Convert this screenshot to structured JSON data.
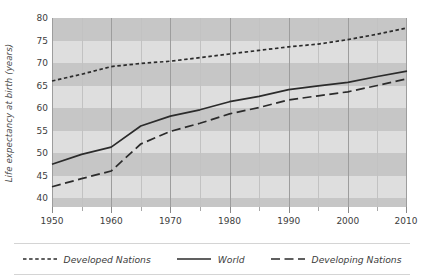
{
  "chart_data": {
    "type": "line",
    "title": "",
    "xlabel": "",
    "ylabel": "Life expectancy at birth (years)",
    "xlim": [
      1950,
      2010
    ],
    "ylim": [
      38,
      80
    ],
    "grid": true,
    "legend_position": "bottom",
    "y_ticks": [
      40,
      45,
      50,
      55,
      60,
      65,
      70,
      75,
      80
    ],
    "x_ticks": [
      1950,
      1960,
      1970,
      1980,
      1990,
      2000,
      2010
    ],
    "x_minor_ticks": [
      1955,
      1965,
      1975,
      1985,
      1995,
      2005
    ],
    "x": [
      1950,
      1955,
      1960,
      1965,
      1970,
      1975,
      1980,
      1985,
      1990,
      1995,
      2000,
      2005,
      2010
    ],
    "series": [
      {
        "name": "Developed Nations",
        "style": "dotted",
        "color": "#2b2b2b",
        "values": [
          66.0,
          67.5,
          69.2,
          69.9,
          70.4,
          71.2,
          72.0,
          72.8,
          73.6,
          74.2,
          75.2,
          76.4,
          77.8
        ]
      },
      {
        "name": "World",
        "style": "solid",
        "color": "#2b2b2b",
        "values": [
          47.5,
          49.7,
          51.3,
          56.0,
          58.2,
          59.6,
          61.4,
          62.6,
          64.1,
          64.9,
          65.7,
          67.0,
          68.2
        ]
      },
      {
        "name": "Developing Nations",
        "style": "dashed",
        "color": "#2b2b2b",
        "values": [
          42.5,
          44.3,
          46.0,
          52.0,
          54.8,
          56.6,
          58.7,
          60.1,
          61.8,
          62.7,
          63.6,
          65.0,
          66.5
        ]
      }
    ]
  },
  "axes": {
    "y_title": "Life expectancy at birth (years)",
    "y_tick_labels": [
      "80",
      "75",
      "70",
      "65",
      "60",
      "55",
      "50",
      "45",
      "40"
    ],
    "x_tick_labels": [
      "1950",
      "1960",
      "1970",
      "1980",
      "1990",
      "2000",
      "2010"
    ]
  },
  "legend": {
    "items": [
      {
        "label": "Developed Nations",
        "style": "dotted"
      },
      {
        "label": "World",
        "style": "solid"
      },
      {
        "label": "Developing Nations",
        "style": "dashed"
      }
    ]
  },
  "colors": {
    "plot_background": "#d9d9d9",
    "band_dark": "#c6c6c6",
    "band_light": "#dedede",
    "gridline": "#9d9d9d",
    "line": "#2b2b2b",
    "text": "#3d3d3d"
  }
}
